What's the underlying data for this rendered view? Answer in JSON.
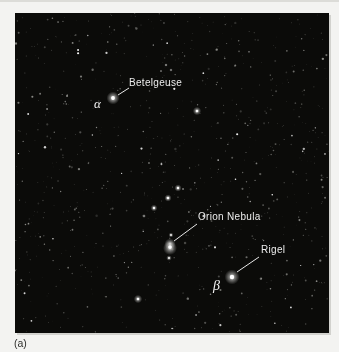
{
  "page": {
    "caption": "(a)",
    "background_color": "#f3f3f1",
    "top_rule_color": "#dcdcd8"
  },
  "photo": {
    "left": 15,
    "top": 13,
    "width": 314,
    "height": 320,
    "background_color": "#0b0b09",
    "label_color": "#ececec",
    "pointer_line_color": "#e8e8e8"
  },
  "annotations": {
    "betelgeuse": {
      "label": "Betelgeuse",
      "greek_letter": "α",
      "label_x": 114,
      "label_y": 65,
      "greek_x": 79,
      "greek_y": 84,
      "line": {
        "x1": 103,
        "y1": 82,
        "x2": 114,
        "y2": 75
      }
    },
    "orion_nebula": {
      "label": "Orion Nebula",
      "label_x": 183,
      "label_y": 199,
      "line": {
        "x1": 159,
        "y1": 228,
        "x2": 182,
        "y2": 211
      }
    },
    "rigel": {
      "label": "Rigel",
      "greek_letter": "β",
      "label_x": 246,
      "label_y": 232,
      "greek_x": 198,
      "greek_y": 266,
      "line": {
        "x1": 222,
        "y1": 259,
        "x2": 244,
        "y2": 244
      }
    }
  },
  "stars": {
    "named": [
      {
        "name": "betelgeuse-alpha-orionis",
        "x": 98,
        "y": 85,
        "core": 1.9,
        "glow": 6.5,
        "brightness": 1.0
      },
      {
        "name": "bellatrix",
        "x": 182,
        "y": 98,
        "core": 1.3,
        "glow": 4.2,
        "brightness": 0.95
      },
      {
        "name": "belt-star-east",
        "x": 163,
        "y": 175,
        "core": 1.2,
        "glow": 3.6,
        "brightness": 0.95
      },
      {
        "name": "belt-star-middle",
        "x": 153,
        "y": 185,
        "core": 1.3,
        "glow": 3.6,
        "brightness": 0.95
      },
      {
        "name": "belt-star-west",
        "x": 139,
        "y": 195,
        "core": 1.2,
        "glow": 3.4,
        "brightness": 0.9
      },
      {
        "name": "belt-faint-star",
        "x": 129,
        "y": 203,
        "core": 0.7,
        "glow": 2.0,
        "brightness": 0.6
      },
      {
        "name": "sword-star-upper",
        "x": 156,
        "y": 222,
        "core": 0.9,
        "glow": 2.5,
        "brightness": 0.85
      },
      {
        "name": "sword-star-lower",
        "x": 154,
        "y": 245,
        "core": 1.0,
        "glow": 2.8,
        "brightness": 0.85
      },
      {
        "name": "rigel-beta-orionis",
        "x": 217,
        "y": 264,
        "core": 2.2,
        "glow": 7.5,
        "brightness": 1.0
      },
      {
        "name": "saiph",
        "x": 123,
        "y": 286,
        "core": 1.3,
        "glow": 4.2,
        "brightness": 0.9
      },
      {
        "name": "head-star-1",
        "x": 151,
        "y": 52,
        "core": 0.7,
        "glow": 1.8,
        "brightness": 0.6
      },
      {
        "name": "head-star-2",
        "x": 156,
        "y": 57,
        "core": 0.7,
        "glow": 1.8,
        "brightness": 0.55
      },
      {
        "name": "head-star-3",
        "x": 146,
        "y": 58,
        "core": 0.6,
        "glow": 1.6,
        "brightness": 0.5
      }
    ],
    "nebula": {
      "name": "orion-nebula",
      "x": 155,
      "y": 234,
      "glow": 7,
      "brightness": 0.95
    },
    "background_noise": {
      "count": 850,
      "bright_count": 45,
      "seed": 7
    }
  }
}
